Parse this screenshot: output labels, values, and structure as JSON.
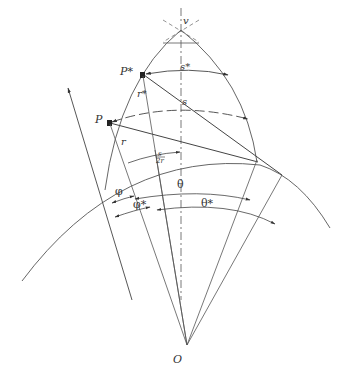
{
  "diagram": {
    "type": "geometric-construction",
    "stroke_color": "#444444",
    "background": "#ffffff",
    "labels": {
      "v": "v",
      "P_star": "P*",
      "s_star": "s*",
      "r_star": "r*",
      "s": "s",
      "P": "P",
      "r": "r",
      "s_over_2r_num": "s",
      "s_over_2r_den": "2r",
      "phi": "φ",
      "phi_star": "φ*",
      "theta": "θ",
      "theta_star": "θ*",
      "O": "O"
    },
    "points": {
      "O": [
        187,
        345
      ],
      "v": [
        181,
        26
      ],
      "P_star": [
        144,
        47
      ],
      "P": [
        108,
        122
      ],
      "s": [
        180,
        104
      ]
    }
  }
}
